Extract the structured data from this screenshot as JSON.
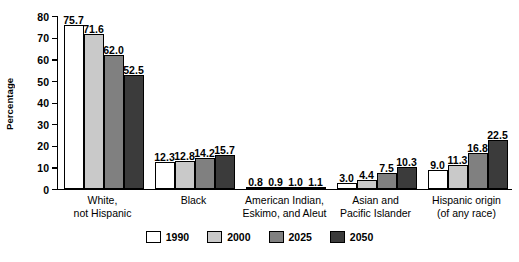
{
  "chart_data": {
    "type": "bar",
    "title": "",
    "subtitle": "",
    "xlabel": "",
    "ylabel": "Percentage",
    "ylim": [
      0,
      80
    ],
    "yticks": [
      0,
      10,
      20,
      30,
      40,
      50,
      60,
      70,
      80
    ],
    "ytick_labels": [
      "0",
      "10",
      "20",
      "30",
      "40",
      "50",
      "60",
      "70",
      "80"
    ],
    "grid": false,
    "legend_position": "bottom",
    "categories": [
      "White,\nnot Hispanic",
      "Black",
      "American Indian,\nEskimo, and Aleut",
      "Asian and\nPacific Islander",
      "Hispanic origin\n(of any race)"
    ],
    "series": [
      {
        "name": "1990",
        "color": "#ffffff",
        "values": [
          75.7,
          12.3,
          0.8,
          3.0,
          9.0
        ],
        "labels": [
          "75.7",
          "12.3",
          "0.8",
          "3.0",
          "9.0"
        ]
      },
      {
        "name": "2000",
        "color": "#c9c9c9",
        "values": [
          71.6,
          12.8,
          0.9,
          4.4,
          11.3
        ],
        "labels": [
          "71.6",
          "12.8",
          "0.9",
          "4.4",
          "11.3"
        ]
      },
      {
        "name": "2025",
        "color": "#808080",
        "values": [
          62.0,
          14.2,
          1.0,
          7.5,
          16.8
        ],
        "labels": [
          "62.0",
          "14.2",
          "1.0",
          "7.5",
          "16.8"
        ]
      },
      {
        "name": "2050",
        "color": "#3b3b3b",
        "values": [
          52.5,
          15.7,
          1.1,
          10.3,
          22.5
        ],
        "labels": [
          "52.5",
          "15.7",
          "1.1",
          "10.3",
          "22.5"
        ]
      }
    ]
  }
}
